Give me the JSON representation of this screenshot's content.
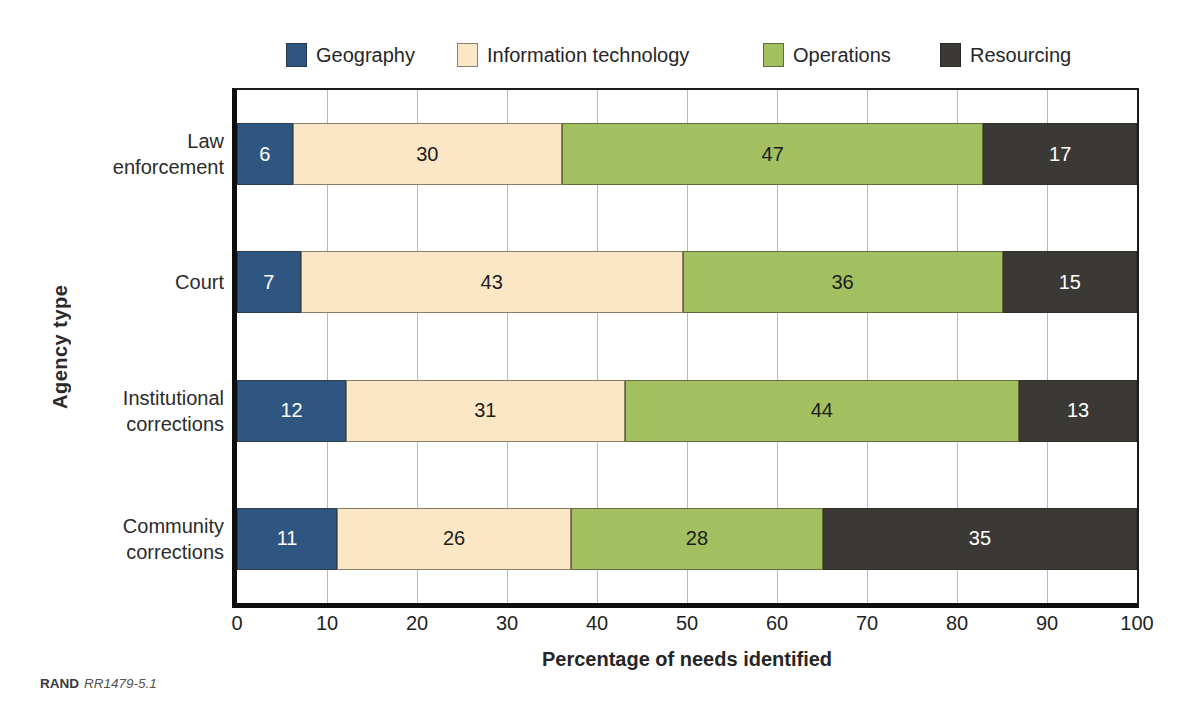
{
  "chart_data": {
    "type": "bar",
    "subtype": "stacked_horizontal",
    "xlabel": "Percentage of needs identified",
    "ylabel": "Agency type",
    "xlim": [
      0,
      100
    ],
    "xticks": [
      0,
      10,
      20,
      30,
      40,
      50,
      60,
      70,
      80,
      90,
      100
    ],
    "grid": "vertical",
    "legend_position": "top",
    "categories": [
      "Law\nenforcement",
      "Court",
      "Institutional\ncorrections",
      "Community\ncorrections"
    ],
    "series": [
      {
        "name": "Geography",
        "color": "#2e5680",
        "label_color": "#ffffff",
        "values": [
          6,
          7,
          12,
          11
        ]
      },
      {
        "name": "Information technology",
        "color": "#fbe7c5",
        "label_color": "#1c1c1c",
        "values": [
          30,
          43,
          31,
          26
        ]
      },
      {
        "name": "Operations",
        "color": "#a2c05f",
        "label_color": "#1c1c1c",
        "values": [
          47,
          36,
          44,
          28
        ]
      },
      {
        "name": "Resourcing",
        "color": "#3b3936",
        "label_color": "#ffffff",
        "values": [
          17,
          15,
          13,
          35
        ]
      }
    ],
    "source": {
      "prefix": "RAND",
      "id": "RR1479-5.1"
    }
  }
}
